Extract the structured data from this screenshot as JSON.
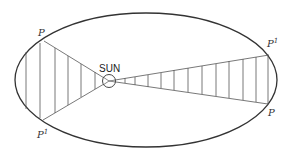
{
  "diagram": {
    "sun_label": "SUN",
    "left_sector": {
      "top_label": "P",
      "bottom_label": "P",
      "bottom_sup": "1"
    },
    "right_sector": {
      "top_label": "P",
      "top_sup": "1",
      "bottom_label": "P"
    },
    "colors": {
      "stroke": "#333333",
      "hatch": "#555555",
      "background": "#ffffff"
    }
  }
}
